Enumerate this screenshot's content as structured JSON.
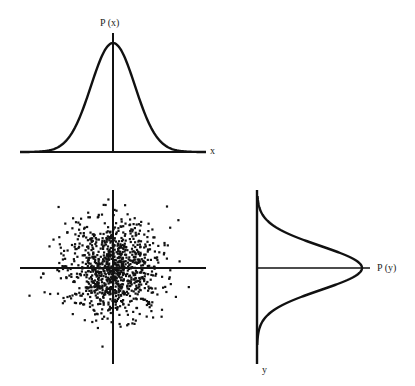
{
  "labels": {
    "px": "P (x)",
    "x": "x",
    "py": "P (y)",
    "y": "y"
  },
  "colors": {
    "ink": "#111111",
    "background": "#ffffff"
  },
  "chart_data": [
    {
      "type": "line",
      "title": "Marginal distribution P(x)",
      "xlabel": "x",
      "ylabel": "P (x)",
      "description": "Gaussian bell curve centered at x=0",
      "mean": 0,
      "sigma": 1,
      "grid": false
    },
    {
      "type": "scatter",
      "title": "Joint distribution of x and y",
      "description": "Roughly 1000 points from an isotropic 2D Gaussian centered at the origin",
      "mean": [
        0,
        0
      ],
      "sigma": [
        1,
        1
      ],
      "n_points": 1000,
      "grid": false
    },
    {
      "type": "line",
      "title": "Marginal distribution P(y)",
      "xlabel": "P (y)",
      "ylabel": "y",
      "description": "Gaussian bell curve centered at y=0, plotted sideways",
      "mean": 0,
      "sigma": 1,
      "grid": false
    }
  ]
}
